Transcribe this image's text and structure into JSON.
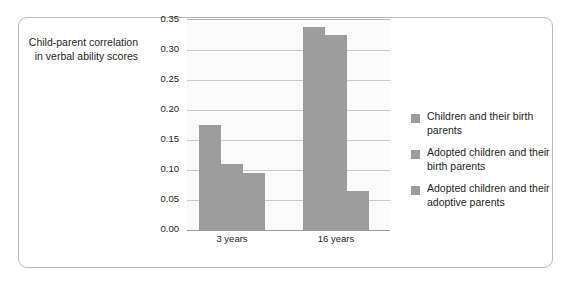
{
  "axis_title": "Child-parent correlation\nin verbal ability scores",
  "legend": {
    "items": [
      {
        "label": "Children and their birth parents",
        "swatch": "legend-swatch-icon",
        "color": "#9d9d9d"
      },
      {
        "label": "Adopted children and their birth parents",
        "swatch": "legend-swatch-icon",
        "color": "#9d9d9d"
      },
      {
        "label": "Adopted children and their adoptive parents",
        "swatch": "legend-swatch-icon",
        "color": "#9d9d9d"
      }
    ]
  },
  "chart_data": {
    "type": "bar",
    "title": "",
    "xlabel": "",
    "ylabel": "Child-parent correlation in verbal ability scores",
    "categories": [
      "3 years",
      "16 years"
    ],
    "series": [
      {
        "name": "Children and their birth parents",
        "values": [
          0.175,
          0.338
        ],
        "color": "#9d9d9d"
      },
      {
        "name": "Adopted children and their birth parents",
        "values": [
          0.11,
          0.325
        ],
        "color": "#9d9d9d"
      },
      {
        "name": "Adopted children and their adoptive parents",
        "values": [
          0.095,
          0.065
        ],
        "color": "#9d9d9d"
      }
    ],
    "ylim": [
      0.0,
      0.35
    ],
    "ytick_labels": [
      "0.35",
      "0.30",
      "0.25",
      "0.20",
      "0.15",
      "0.10",
      "0.05",
      "0.00"
    ],
    "ytick_values": [
      0.35,
      0.3,
      0.25,
      0.2,
      0.15,
      0.1,
      0.05,
      0.0
    ],
    "grid": true,
    "legend_position": "right"
  }
}
